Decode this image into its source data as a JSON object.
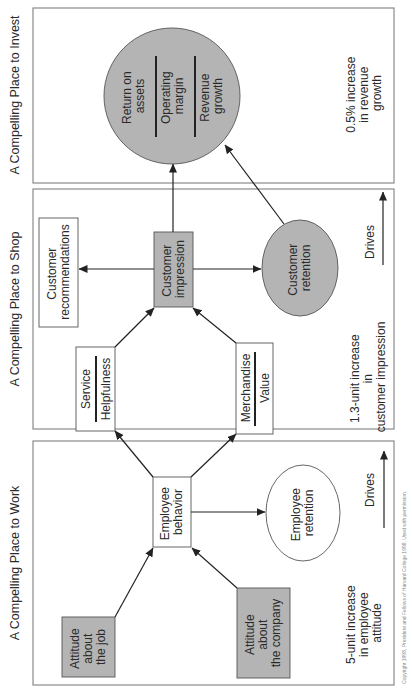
{
  "panels": {
    "work": {
      "title": "A Compelling Place to Work",
      "attitude_job": [
        "Attitude",
        "about",
        "the job"
      ],
      "attitude_company": [
        "Attitude",
        "about",
        "the company"
      ],
      "employee_behavior": [
        "Employee",
        "behavior"
      ],
      "employee_retention": [
        "Employee",
        "retention"
      ],
      "metric": [
        "5-unit increase",
        "in employee",
        "attitude"
      ],
      "drives_label": "Drives"
    },
    "shop": {
      "title": "A Compelling Place to Shop",
      "service": {
        "top": "Service",
        "bottom": "Helpfulness"
      },
      "merchandise": {
        "top": "Merchandise",
        "bottom": "Value"
      },
      "customer_impression": [
        "Customer",
        "impression"
      ],
      "customer_recommendations": [
        "Customer",
        "recommendations"
      ],
      "customer_retention": [
        "Customer",
        "retention"
      ],
      "metric": [
        "1.3-unit increase",
        "in",
        "customer impression"
      ],
      "drives_label": "Drives"
    },
    "invest": {
      "title": "A Compelling Place to Invest",
      "outcomes": [
        [
          "Return on",
          "assets"
        ],
        [
          "Operating",
          "margin"
        ],
        [
          "Revenue",
          "growth"
        ]
      ],
      "metric": [
        "0.5% increase",
        "in revenue",
        "growth"
      ]
    }
  },
  "caption": "Copyright 1998, President and Fellows of Harvard College 1998. Used with permission.",
  "colors": {
    "gray_fill": "#b4b4b4",
    "panel_border": "#8a8a8a",
    "line": "#222222"
  }
}
